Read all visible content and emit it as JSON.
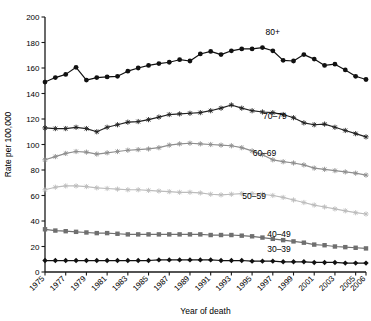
{
  "chart_data": {
    "type": "line",
    "title": "",
    "xlabel": "Year of death",
    "ylabel": "Rate per 100,000",
    "xlim": [
      1975,
      2006
    ],
    "ylim": [
      0,
      200
    ],
    "yticks": [
      0,
      20,
      40,
      60,
      80,
      100,
      120,
      140,
      160,
      180,
      200
    ],
    "xticks": [
      1975,
      1977,
      1979,
      1981,
      1983,
      1985,
      1987,
      1989,
      1991,
      1993,
      1995,
      1997,
      1999,
      2001,
      2003,
      2005,
      2006
    ],
    "grid": false,
    "legend_position": "inline-right",
    "x": [
      1975,
      1976,
      1977,
      1978,
      1979,
      1980,
      1981,
      1982,
      1983,
      1984,
      1985,
      1986,
      1987,
      1988,
      1989,
      1990,
      1991,
      1992,
      1993,
      1994,
      1995,
      1996,
      1997,
      1998,
      1999,
      2000,
      2001,
      2002,
      2003,
      2004,
      2005,
      2006
    ],
    "series": [
      {
        "name": "80+",
        "label": "80+",
        "color": "#111111",
        "marker": "circle",
        "values": [
          149.0,
          152.5,
          155.0,
          160.5,
          150.5,
          152.5,
          153.0,
          153.5,
          157.5,
          160.0,
          162.0,
          163.5,
          164.5,
          166.5,
          165.5,
          171.0,
          173.0,
          170.5,
          173.5,
          175.0,
          175.0,
          176.0,
          173.5,
          166.0,
          165.5,
          170.5,
          167.0,
          162.0,
          163.0,
          158.5,
          153.5,
          151.0
        ]
      },
      {
        "name": "70-79",
        "label": "70–79",
        "color": "#222222",
        "marker": "cross",
        "values": [
          113.0,
          112.5,
          112.5,
          113.5,
          112.5,
          110.0,
          113.5,
          115.5,
          117.5,
          118.0,
          119.5,
          121.5,
          123.5,
          124.0,
          124.5,
          125.0,
          126.5,
          128.5,
          131.0,
          128.5,
          126.5,
          125.5,
          125.0,
          123.5,
          121.0,
          117.0,
          115.5,
          116.0,
          113.5,
          111.0,
          108.5,
          106.0
        ]
      },
      {
        "name": "60-69",
        "label": "60–69",
        "color": "#8e8e8e",
        "marker": "cross",
        "values": [
          88.0,
          90.5,
          93.0,
          94.5,
          94.0,
          92.5,
          93.5,
          94.5,
          95.5,
          96.0,
          96.5,
          97.5,
          99.5,
          100.5,
          101.0,
          100.5,
          100.0,
          99.5,
          99.0,
          97.5,
          95.0,
          92.0,
          88.0,
          86.5,
          85.5,
          84.0,
          81.5,
          80.5,
          79.5,
          78.5,
          77.5,
          76.0
        ]
      },
      {
        "name": "50-59",
        "label": "50–59",
        "color": "#bcbcbc",
        "marker": "cross",
        "values": [
          64.5,
          66.5,
          67.5,
          67.5,
          67.0,
          66.0,
          65.5,
          65.0,
          64.5,
          64.5,
          64.0,
          63.5,
          63.0,
          62.5,
          62.5,
          62.0,
          61.0,
          60.5,
          61.0,
          61.5,
          61.5,
          61.0,
          60.0,
          58.5,
          56.5,
          54.5,
          52.5,
          51.0,
          49.5,
          48.0,
          46.5,
          45.5
        ]
      },
      {
        "name": "40-49",
        "label": "40–49",
        "color": "#6f6f6f",
        "marker": "square",
        "values": [
          33.5,
          32.5,
          32.0,
          31.5,
          31.0,
          30.5,
          30.5,
          30.0,
          29.5,
          29.5,
          29.5,
          29.5,
          29.5,
          29.5,
          29.5,
          29.5,
          29.0,
          29.0,
          29.0,
          28.5,
          28.0,
          27.0,
          26.0,
          25.0,
          24.0,
          23.0,
          21.5,
          21.0,
          20.0,
          19.5,
          19.0,
          18.5
        ]
      },
      {
        "name": "30-39",
        "label": "30–39",
        "color": "#111111",
        "marker": "diamond",
        "values": [
          9.0,
          9.0,
          9.0,
          9.0,
          9.0,
          9.0,
          9.0,
          9.0,
          9.0,
          9.0,
          9.0,
          9.5,
          9.5,
          9.5,
          9.5,
          9.5,
          9.5,
          9.0,
          9.0,
          9.0,
          8.5,
          8.5,
          8.5,
          8.0,
          8.0,
          8.0,
          7.5,
          7.5,
          7.5,
          7.0,
          7.0,
          7.0
        ]
      }
    ],
    "series_label_positions": [
      {
        "name": "80+",
        "x": 1997.0,
        "y": 186.0
      },
      {
        "name": "70-79",
        "x": 1997.2,
        "y": 120.0
      },
      {
        "name": "60-69",
        "x": 1996.2,
        "y": 91.0
      },
      {
        "name": "50-59",
        "x": 1995.2,
        "y": 57.0
      },
      {
        "name": "40-49",
        "x": 1997.6,
        "y": 27.5
      },
      {
        "name": "30-39",
        "x": 1997.6,
        "y": 15.5
      }
    ]
  }
}
